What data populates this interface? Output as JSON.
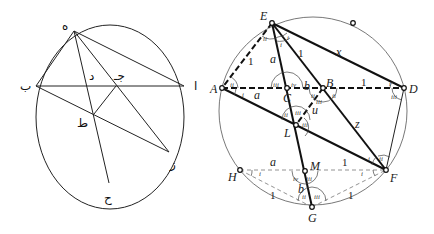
{
  "left_figure": {
    "labels": {
      "h": "ه",
      "b": "ب",
      "a": "ا",
      "d": "د",
      "j": "جـ",
      "t": "ط",
      "z": "ز",
      "hh": "ح"
    }
  },
  "right_figure": {
    "points": {
      "E": "E",
      "A": "A",
      "C": "C",
      "B": "B",
      "D": "D",
      "L": "L",
      "M": "M",
      "H": "H",
      "F": "F",
      "G": "G"
    },
    "segments": {
      "EA": "1",
      "EC": "a",
      "EB": "1",
      "ED": "x",
      "AC": "a",
      "CB": "b",
      "BD": "1",
      "BL": "u",
      "BF": "z",
      "HM": "a",
      "MF": "1",
      "MG": "b",
      "HG": "1",
      "GF": "1"
    },
    "angles": {
      "E_left": "ii",
      "E_mid": "i",
      "E_right": "i",
      "A_top": "ii",
      "A_bot": "i",
      "C_left": "iii",
      "C_right": "iv",
      "B_left": "ii",
      "B_mid": "iii",
      "B_right": "ii",
      "D_top": "i",
      "D_bot": "iii",
      "L_left": "ii",
      "L_mid": "iii",
      "L_right": "iii",
      "F_left": "i",
      "F_top": "ii",
      "F_bot": "i",
      "H": "i",
      "M_left": "iv",
      "M_right": "iii",
      "G_left": "ii",
      "G_right": "iii"
    }
  }
}
